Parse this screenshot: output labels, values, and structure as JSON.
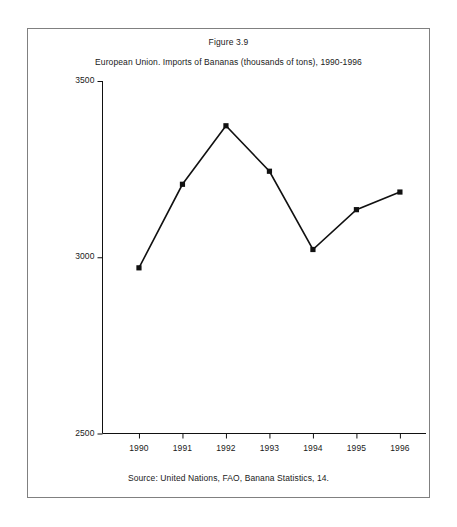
{
  "figure": {
    "title": "Figure 3.9",
    "subtitle": "European Union. Imports of Bananas (thousands of tons), 1990-1996",
    "source": "Source: United Nations, FAO, Banana Statistics, 14.",
    "border_color": "#808080",
    "line_color": "#111111",
    "marker_color": "#111111",
    "background": "#ffffff"
  },
  "chart_data": {
    "type": "line",
    "title": "European Union. Imports of Bananas (thousands of tons), 1990-1996",
    "xlabel": "",
    "ylabel": "",
    "categories": [
      "1990",
      "1991",
      "1992",
      "1993",
      "1994",
      "1995",
      "1996"
    ],
    "x": [
      1990,
      1991,
      1992,
      1993,
      1994,
      1995,
      1996
    ],
    "values": [
      2970,
      3207,
      3373,
      3244,
      3022,
      3135,
      3185
    ],
    "series": [
      {
        "name": "Imports of Bananas",
        "values": [
          2970,
          3207,
          3373,
          3244,
          3022,
          3135,
          3185
        ]
      }
    ],
    "ylim": [
      2500,
      3500
    ],
    "yticks": [
      2500,
      3000,
      3500
    ],
    "ytick_labels": [
      "2500",
      "3000",
      "3500"
    ],
    "xtick_labels": [
      "1990",
      "1991",
      "1992",
      "1993",
      "1994",
      "1995",
      "1996"
    ],
    "grid": false,
    "legend": false,
    "marker": "square",
    "units": "thousands of tons"
  }
}
